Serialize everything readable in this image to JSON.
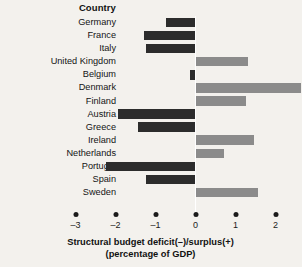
{
  "header": {
    "column_title": "Country"
  },
  "axis": {
    "title_line1": "Structural budget deficit(–)/surplus(+)",
    "title_line2": "(percentage of GDP)",
    "tick_labels": [
      "–3",
      "–2",
      "–1",
      "0",
      "1",
      "2"
    ]
  },
  "colors": {
    "background": "#f3f1ed",
    "deficit_bar": "#2c2c2c",
    "surplus_bar": "#8b8b8b",
    "zero_line": "#ffffff",
    "text": "#141414"
  },
  "chart_data": {
    "type": "bar",
    "orientation": "horizontal",
    "title": "",
    "xlabel": "Structural budget deficit(–)/surplus(+) (percentage of GDP)",
    "ylabel": "Country",
    "xlim": [
      -3.2,
      2.15
    ],
    "xticks": [
      -3,
      -2,
      -1,
      0,
      1,
      2
    ],
    "grid": false,
    "legend": "none",
    "categories": [
      "Germany",
      "France",
      "Italy",
      "United Kingdom",
      "Belgium",
      "Denmark",
      "Finland",
      "Austria",
      "Greece",
      "Ireland",
      "Netherlands",
      "Portugal",
      "Spain",
      "Sweden"
    ],
    "values": [
      -0.75,
      -1.3,
      -1.25,
      1.3,
      -0.15,
      2.65,
      1.25,
      -1.95,
      -1.45,
      1.45,
      0.7,
      -2.25,
      -1.25,
      1.55
    ]
  }
}
